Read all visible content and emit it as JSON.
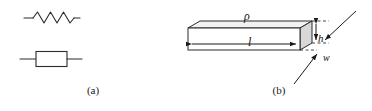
{
  "figure": {
    "panels": [
      {
        "id": "a",
        "caption": "(a)",
        "symbols": [
          {
            "name": "zigzag-resistor-symbol",
            "type": "zigzag"
          },
          {
            "name": "box-resistor-symbol",
            "type": "box"
          }
        ]
      },
      {
        "id": "b",
        "caption": "(b)",
        "labels": {
          "resistivity": "ρ",
          "length": "l",
          "height": "h",
          "width": "w"
        }
      }
    ]
  },
  "colors": {
    "stroke": "#2b2b2b",
    "fill_front": "#ffffff",
    "fill_top": "#f2f2f2",
    "fill_end": "#d8d8d8",
    "text": "#1a1a1a",
    "background": "#ffffff"
  }
}
